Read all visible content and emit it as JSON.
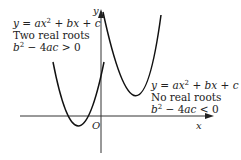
{
  "diagram": {
    "type": "graph-of-quadratics",
    "axes": {
      "x_label": "x",
      "y_label": "y",
      "origin_label": "O"
    },
    "curves": [
      {
        "id": "two-real-roots",
        "equation": "y = ax² + bx + c",
        "description": "Two real roots",
        "condition": "b² − 4ac > 0"
      },
      {
        "id": "no-real-roots",
        "equation": "y = ax² + bx + c",
        "description": "No real roots",
        "condition": "b² − 4ac < 0"
      }
    ],
    "colors": {
      "curve": "#111111",
      "axis": "#333333",
      "text": "#222222"
    }
  },
  "labels": {
    "left": {
      "eq_y": "y",
      "eq_eq": " = ",
      "eq_a": "ax",
      "eq_sq": "2",
      "eq_rest1": " + ",
      "eq_bx": "bx",
      "eq_rest2": " + ",
      "eq_c": "c",
      "desc": "Two real roots",
      "cond_b": "b",
      "cond_sq": "2",
      "cond_mid": " − 4",
      "cond_ac": "ac",
      "cond_op": " > 0"
    },
    "right": {
      "eq_y": "y",
      "eq_eq": " = ",
      "eq_a": "ax",
      "eq_sq": "2",
      "eq_rest1": " + ",
      "eq_bx": "bx",
      "eq_rest2": " + ",
      "eq_c": "c",
      "desc": "No real roots",
      "cond_b": "b",
      "cond_sq": "2",
      "cond_mid": " − 4",
      "cond_ac": "ac",
      "cond_op": " < 0"
    },
    "x_axis": "x",
    "y_axis": "y",
    "origin": "O"
  }
}
